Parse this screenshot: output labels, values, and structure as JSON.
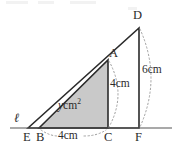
{
  "figure": {
    "line_label": "ℓ",
    "vertices": [
      {
        "name": "D",
        "label": "D",
        "x": 139,
        "y": 28,
        "label_x": 133,
        "label_y": 9
      },
      {
        "name": "A",
        "label": "A",
        "x": 108,
        "y": 60,
        "label_x": 108,
        "label_y": 47
      },
      {
        "name": "E",
        "label": "E",
        "x": 28,
        "y": 128,
        "label_x": 23,
        "label_y": 131
      },
      {
        "name": "B",
        "label": "B",
        "x": 39,
        "y": 128,
        "label_x": 36,
        "label_y": 131
      },
      {
        "name": "C",
        "label": "C",
        "x": 108,
        "y": 128,
        "label_x": 104,
        "label_y": 131
      },
      {
        "name": "F",
        "label": "F",
        "x": 139,
        "y": 128,
        "label_x": 135,
        "label_y": 131
      }
    ],
    "dimensions": [
      {
        "name": "height-df",
        "label": "6cm",
        "x": 142,
        "y": 70
      },
      {
        "name": "height-ac",
        "label": "4cm",
        "x": 110,
        "y": 84
      },
      {
        "name": "base-bc",
        "label": "4cm",
        "x": 60,
        "y": 133
      }
    ],
    "area_label": {
      "variable": "y",
      "unit": "cm",
      "exponent": "2",
      "x": 57,
      "y": 105
    },
    "shaded_triangle": {
      "name": "triangle-BAC",
      "points": "39,128 108,60 108,128",
      "fill": "#c9c9c9",
      "stroke": "#2b2b2b"
    },
    "outline_triangle": {
      "name": "triangle-EDF",
      "points": "28,128 139,28 139,128",
      "fill": "none",
      "stroke": "#2b2b2b"
    },
    "baseline": {
      "name": "line-l",
      "x1": 10,
      "y1": 128,
      "x2": 172,
      "y2": 128,
      "stroke": "#555555"
    },
    "colors": {
      "ink": "#2b2b2b",
      "shade": "#c9c9c9",
      "baseline": "#555555",
      "dotted": "#9a9a9a",
      "background": "#ffffff"
    }
  }
}
